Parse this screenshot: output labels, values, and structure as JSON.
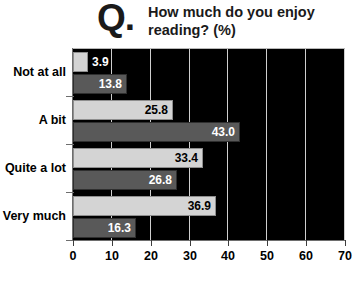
{
  "header": {
    "q_symbol": "Q.",
    "title_line1": "How much do you enjoy",
    "title_line2": "reading? (%)"
  },
  "colors": {
    "plot_background": "#000000",
    "gridline": "#cfcfcf",
    "series_1": "#d4d4d4",
    "series_2": "#595959",
    "text": "#000000"
  },
  "chart_data": {
    "type": "bar",
    "orientation": "horizontal",
    "title": "How much do you enjoy reading? (%)",
    "xlabel": "",
    "ylabel": "",
    "xlim": [
      0,
      70
    ],
    "xticks": [
      0,
      10,
      20,
      30,
      40,
      50,
      60,
      70
    ],
    "xtick_labels": [
      "0",
      "10",
      "20",
      "30",
      "40",
      "50",
      "60",
      "70"
    ],
    "grid": true,
    "legend": false,
    "categories": [
      "Not at all",
      "A bit",
      "Quite a lot",
      "Very much"
    ],
    "series": [
      {
        "name": "series-1",
        "color": "#d4d4d4",
        "values": [
          3.9,
          25.8,
          33.4,
          36.9
        ],
        "labels": [
          "3.9",
          "25.8",
          "33.4",
          "36.9"
        ]
      },
      {
        "name": "series-2",
        "color": "#595959",
        "values": [
          13.8,
          43.0,
          26.8,
          16.3
        ],
        "labels": [
          "13.8",
          "43.0",
          "26.8",
          "16.3"
        ]
      }
    ]
  }
}
